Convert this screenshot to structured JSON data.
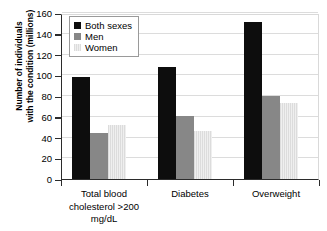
{
  "chart_data": {
    "type": "bar",
    "title": "",
    "subtitle": "",
    "xlabel": "",
    "ylabel": "Number of individuals with the condition (millions)",
    "ylabel_lines": [
      "Number of individuals",
      "with the condition (millions)"
    ],
    "ylim": [
      0,
      160
    ],
    "ytick_values": [
      0,
      20,
      40,
      60,
      80,
      100,
      120,
      140,
      160
    ],
    "ytick_labels": [
      "0",
      "20",
      "40",
      "60",
      "80",
      "100",
      "120",
      "140",
      "160"
    ],
    "grid": true,
    "grid_axis": "y",
    "legend_position": "upper left",
    "categories": [
      "Total blood cholesterol >200 mg/dL",
      "Diabetes",
      "Overweight"
    ],
    "category_label_lines": [
      [
        "Total blood",
        "cholesterol >200",
        "mg/dL"
      ],
      [
        "Diabetes"
      ],
      [
        "Overweight"
      ]
    ],
    "series": [
      {
        "name": "Both sexes",
        "color": "#0d0d0d",
        "values": [
          98,
          108,
          151
        ]
      },
      {
        "name": "Men",
        "color": "#878787",
        "values": [
          44,
          61,
          80
        ]
      },
      {
        "name": "Women",
        "color": "#e0e0e0",
        "values": [
          52,
          46,
          73
        ]
      }
    ]
  },
  "legend": {
    "items": [
      {
        "label": "Both sexes"
      },
      {
        "label": "Men"
      },
      {
        "label": "Women"
      }
    ]
  },
  "axis": {
    "y_title_line1": "Number of individuals",
    "y_title_line2": "with the condition (millions)"
  }
}
